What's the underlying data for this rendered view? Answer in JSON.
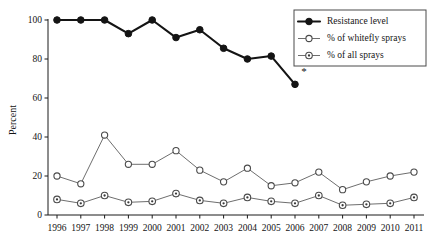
{
  "chart_data": {
    "type": "line",
    "title": "",
    "xlabel": "",
    "ylabel": "Percent",
    "ylim": [
      0,
      100
    ],
    "yticks": [
      0,
      20,
      40,
      60,
      80,
      100
    ],
    "grid": false,
    "legend_position": "top-right",
    "x": [
      1996,
      1997,
      1998,
      1999,
      2000,
      2001,
      2002,
      2003,
      2004,
      2005,
      2006,
      2007,
      2008,
      2009,
      2010,
      2011
    ],
    "categories": [
      "1996",
      "1997",
      "1998",
      "1999",
      "2000",
      "2001",
      "2002",
      "2003",
      "2004",
      "2005",
      "2006",
      "2007",
      "2008",
      "2009",
      "2010",
      "2011"
    ],
    "annotations": [
      {
        "text": "*",
        "x": 2006,
        "y": 72,
        "note": "asterisk beside final resistance level point"
      }
    ],
    "series": [
      {
        "name": "Resistance level",
        "marker": "filled-circle",
        "color": "#141414",
        "values": [
          100,
          100,
          100,
          93,
          100,
          91,
          95,
          85.5,
          80,
          81.5,
          67,
          null,
          null,
          null,
          null,
          null
        ]
      },
      {
        "name": "% of whitefly sprays",
        "marker": "open-circle",
        "color": "#6e6e6e",
        "values": [
          20,
          16,
          41,
          26,
          26,
          33,
          23,
          17,
          24,
          15,
          16.5,
          22,
          13,
          17,
          20,
          22
        ]
      },
      {
        "name": "% of all sprays",
        "marker": "dotted-circle",
        "color": "#6e6e6e",
        "values": [
          8,
          6,
          10,
          6.5,
          7,
          11,
          7.5,
          6,
          9,
          7,
          6,
          10,
          5,
          5.5,
          6,
          9
        ]
      }
    ]
  },
  "axes": {
    "y_title": "Percent",
    "y_tick_labels": [
      "0",
      "20",
      "40",
      "60",
      "80",
      "100"
    ],
    "x_tick_labels": [
      "1996",
      "1997",
      "1998",
      "1999",
      "2000",
      "2001",
      "2002",
      "2003",
      "2004",
      "2005",
      "2006",
      "2007",
      "2008",
      "2009",
      "2010",
      "2011"
    ]
  },
  "legend": {
    "items": [
      {
        "label": "Resistance level",
        "marker": "filled-circle"
      },
      {
        "label": "% of whitefly sprays",
        "marker": "open-circle"
      },
      {
        "label": "% of all sprays",
        "marker": "dotted-circle"
      }
    ]
  },
  "colors": {
    "resistance": "#141414",
    "open_series": "#6e6e6e",
    "axis": "#1a1a1a",
    "background": "#ffffff"
  }
}
